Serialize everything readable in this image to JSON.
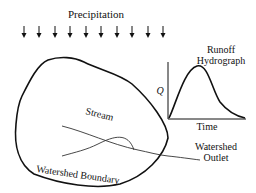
{
  "diagram": {
    "title": "Precipitation",
    "hydrograph": {
      "title_line1": "Runoff",
      "title_line2": "Hydrograph",
      "y_axis_label": "Q",
      "x_axis_label": "Time"
    },
    "labels": {
      "stream": "Stream",
      "boundary": "Watershed Boundary",
      "outlet_line1": "Watershed",
      "outlet_line2": "Outlet"
    },
    "rain_arrow_count": 10,
    "colors": {
      "line": "#111111",
      "stream": "#333333",
      "background": "#ffffff"
    }
  }
}
